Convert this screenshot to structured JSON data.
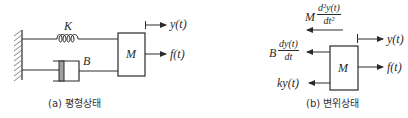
{
  "diagram": {
    "type": "mass-spring-damper",
    "panel_a": {
      "caption": "(a) 평형상태",
      "labels": {
        "spring": "K",
        "damper": "B",
        "mass": "M",
        "displacement": "y(t)",
        "force": "f(t)"
      }
    },
    "panel_b": {
      "caption": "(b) 변위상태",
      "labels": {
        "mass": "M",
        "displacement": "y(t)",
        "force": "f(t)",
        "inertia_coef": "M",
        "inertia_num": "d²y(t)",
        "inertia_den": "dt²",
        "damping_coef": "B",
        "damping_num": "dy(t)",
        "damping_den": "dt",
        "spring_force": "ky(t)"
      }
    },
    "colors": {
      "line": "#2a2a2a",
      "hatch": "#555555",
      "piston": "#a0a0a0"
    }
  }
}
